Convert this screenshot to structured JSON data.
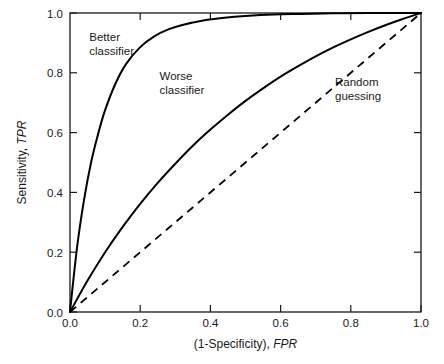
{
  "chart_data": {
    "type": "line",
    "title": "",
    "xlabel": "(1-Specificity), FPR",
    "xlabel_plain": "(1-Specificity), ",
    "xlabel_italic": "FPR",
    "ylabel": "Sensitivity, TPR",
    "ylabel_plain": "Sensitivity, ",
    "ylabel_italic": "TPR",
    "xlim": [
      0.0,
      1.0
    ],
    "ylim": [
      0.0,
      1.0
    ],
    "grid": false,
    "legend": "none",
    "xticks": [
      "0.0",
      "0.2",
      "0.4",
      "0.6",
      "0.8",
      "1.0"
    ],
    "xtick_values": [
      0.0,
      0.2,
      0.4,
      0.6,
      0.8,
      1.0
    ],
    "yticks": [
      "0.0",
      "0.2",
      "0.4",
      "0.6",
      "0.8",
      "1.0"
    ],
    "ytick_values": [
      0.0,
      0.2,
      0.4,
      0.6,
      0.8,
      1.0
    ],
    "series": [
      {
        "name": "Better classifier",
        "style": "solid",
        "color": "#000000",
        "x": [
          0.0,
          0.02,
          0.04,
          0.06,
          0.08,
          0.1,
          0.13,
          0.16,
          0.2,
          0.24,
          0.28,
          0.32,
          0.38,
          0.44,
          0.5,
          0.58,
          0.66,
          0.75,
          0.85,
          1.0
        ],
        "y": [
          0.0,
          0.215,
          0.375,
          0.5,
          0.595,
          0.675,
          0.765,
          0.83,
          0.886,
          0.922,
          0.945,
          0.96,
          0.975,
          0.984,
          0.99,
          0.995,
          0.997,
          0.999,
          1.0,
          1.0
        ]
      },
      {
        "name": "Worse classifier",
        "style": "solid",
        "color": "#000000",
        "x": [
          0.0,
          0.05,
          0.1,
          0.15,
          0.2,
          0.25,
          0.3,
          0.35,
          0.4,
          0.45,
          0.5,
          0.55,
          0.6,
          0.65,
          0.7,
          0.75,
          0.8,
          0.85,
          0.9,
          0.95,
          1.0
        ],
        "y": [
          0.0,
          0.105,
          0.2,
          0.285,
          0.362,
          0.432,
          0.496,
          0.556,
          0.61,
          0.66,
          0.706,
          0.748,
          0.787,
          0.822,
          0.855,
          0.885,
          0.912,
          0.937,
          0.96,
          0.981,
          1.0
        ]
      },
      {
        "name": "Random guessing",
        "style": "dashed",
        "color": "#000000",
        "x": [
          0.0,
          1.0
        ],
        "y": [
          0.0,
          1.0
        ]
      }
    ],
    "annotations": [
      {
        "id": "better",
        "line1": "Better",
        "line2": "classifier",
        "x": 0.055,
        "y": 0.905
      },
      {
        "id": "worse",
        "line1": "Worse",
        "line2": "classifier",
        "x": 0.255,
        "y": 0.775
      },
      {
        "id": "random",
        "line1": "Random",
        "line2": "guessing",
        "x": 0.755,
        "y": 0.755
      }
    ]
  }
}
